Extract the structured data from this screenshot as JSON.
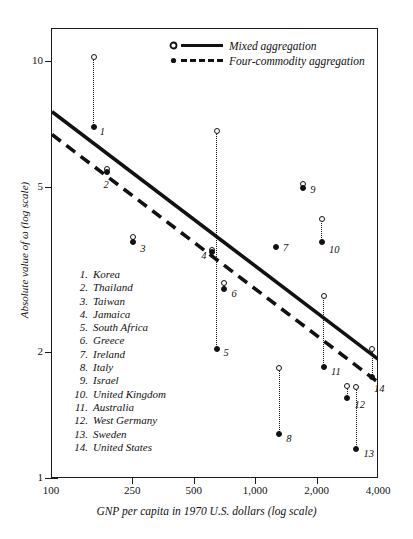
{
  "chart_data": {
    "type": "scatter",
    "title": "",
    "xlabel": "GNP per capita in 1970 U.S. dollars (log scale)",
    "ylabel": "Absolute value of ω (log scale)",
    "xscale": "log",
    "yscale": "log",
    "xlim": [
      100,
      4000
    ],
    "ylim": [
      1,
      12
    ],
    "xticks": [
      "100",
      "250",
      "500",
      "1,000",
      "2,000",
      "4,000"
    ],
    "xtick_values": [
      100,
      250,
      500,
      1000,
      2000,
      4000
    ],
    "yticks": [
      "10",
      "5",
      "2",
      "1"
    ],
    "ytick_values": [
      10,
      5,
      2,
      1
    ],
    "grid": false,
    "legend_position": "top-right",
    "legend": [
      {
        "label": "Mixed aggregation",
        "marker": "open-circle",
        "line": "solid"
      },
      {
        "label": "Four-commodity aggregation",
        "marker": "filled-circle",
        "line": "dashed"
      }
    ],
    "series": [
      {
        "name": "Mixed aggregation",
        "marker": "open-circle",
        "points": [
          {
            "id": 1,
            "country": "Korea",
            "x": 160,
            "y": 10.3
          },
          {
            "id": 2,
            "country": "Thailand",
            "x": 185,
            "y": 5.55
          },
          {
            "id": 3,
            "country": "Taiwan",
            "x": 250,
            "y": 3.8
          },
          {
            "id": 4,
            "country": "Jamaica",
            "x": 610,
            "y": 3.55
          },
          {
            "id": 5,
            "country": "South Africa",
            "x": 640,
            "y": 6.85
          },
          {
            "id": 6,
            "country": "Greece",
            "x": 700,
            "y": 2.95
          },
          {
            "id": 8,
            "country": "Italy",
            "x": 1300,
            "y": 1.85
          },
          {
            "id": 9,
            "country": "Israel",
            "x": 1700,
            "y": 5.1
          },
          {
            "id": 10,
            "country": "United Kingdom",
            "x": 2100,
            "y": 4.2
          },
          {
            "id": 11,
            "country": "Australia",
            "x": 2150,
            "y": 2.75
          },
          {
            "id": 12,
            "country": "West Germany",
            "x": 2800,
            "y": 1.67
          },
          {
            "id": 13,
            "country": "Sweden",
            "x": 3100,
            "y": 1.66
          },
          {
            "id": 14,
            "country": "United States",
            "x": 3700,
            "y": 2.05
          }
        ]
      },
      {
        "name": "Four-commodity aggregation",
        "marker": "filled-circle",
        "points": [
          {
            "id": 1,
            "country": "Korea",
            "x": 160,
            "y": 7.0
          },
          {
            "id": 2,
            "country": "Thailand",
            "x": 185,
            "y": 5.45
          },
          {
            "id": 3,
            "country": "Taiwan",
            "x": 250,
            "y": 3.7
          },
          {
            "id": 4,
            "country": "Jamaica",
            "x": 610,
            "y": 3.5
          },
          {
            "id": 5,
            "country": "South Africa",
            "x": 640,
            "y": 2.05
          },
          {
            "id": 6,
            "country": "Greece",
            "x": 700,
            "y": 2.85
          },
          {
            "id": 7,
            "country": "Ireland",
            "x": 1250,
            "y": 3.6
          },
          {
            "id": 8,
            "country": "Italy",
            "x": 1300,
            "y": 1.28
          },
          {
            "id": 9,
            "country": "Israel",
            "x": 1700,
            "y": 5.0
          },
          {
            "id": 10,
            "country": "United Kingdom",
            "x": 2100,
            "y": 3.7
          },
          {
            "id": 11,
            "country": "Australia",
            "x": 2150,
            "y": 1.86
          },
          {
            "id": 12,
            "country": "West Germany",
            "x": 2800,
            "y": 1.56
          },
          {
            "id": 13,
            "country": "Sweden",
            "x": 3100,
            "y": 1.18
          },
          {
            "id": 14,
            "country": "United States",
            "x": 3700,
            "y": 1.76
          }
        ]
      }
    ],
    "trend_lines": [
      {
        "name": "Mixed aggregation",
        "style": "solid",
        "x0": 100,
        "y0": 7.6,
        "x1": 4000,
        "y1": 1.93
      },
      {
        "name": "Four-commodity aggregation",
        "style": "dashed",
        "x0": 100,
        "y0": 6.7,
        "x1": 4000,
        "y1": 1.7
      }
    ]
  },
  "legend": {
    "items": [
      {
        "label": "Mixed aggregation"
      },
      {
        "label": "Four-commodity aggregation"
      }
    ]
  },
  "axes": {
    "y_title": "Absolute value of ω (log scale)",
    "x_title": "GNP per capita in 1970 U.S. dollars (log scale)",
    "y_ticks": [
      "10",
      "5",
      "2",
      "1"
    ],
    "x_ticks": [
      "100",
      "250",
      "500",
      "1,000",
      "2,000",
      "4,000"
    ]
  },
  "country_list": [
    {
      "num": "1.",
      "name": "Korea"
    },
    {
      "num": "2.",
      "name": "Thailand"
    },
    {
      "num": "3.",
      "name": "Taiwan"
    },
    {
      "num": "4.",
      "name": "Jamaica"
    },
    {
      "num": "5.",
      "name": "South Africa"
    },
    {
      "num": "6.",
      "name": "Greece"
    },
    {
      "num": "7.",
      "name": "Ireland"
    },
    {
      "num": "8.",
      "name": "Italy"
    },
    {
      "num": "9.",
      "name": "Israel"
    },
    {
      "num": "10.",
      "name": "United Kingdom"
    },
    {
      "num": "11.",
      "name": "Australia"
    },
    {
      "num": "12.",
      "name": "West Germany"
    },
    {
      "num": "13.",
      "name": "Sweden"
    },
    {
      "num": "14.",
      "name": "United States"
    }
  ],
  "point_labels": [
    "1",
    "2",
    "3",
    "4",
    "5",
    "6",
    "7",
    "8",
    "9",
    "10",
    "11",
    "12",
    "13",
    "14"
  ],
  "colors": {
    "ink": "#111111",
    "background": "#ffffff"
  }
}
